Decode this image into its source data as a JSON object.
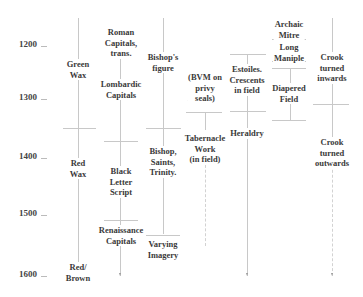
{
  "timeline": {
    "years": [
      {
        "label": "1200",
        "y": 44
      },
      {
        "label": "1300",
        "y": 97
      },
      {
        "label": "1400",
        "y": 156
      },
      {
        "label": "1500",
        "y": 213
      },
      {
        "label": "1600",
        "y": 274
      }
    ]
  },
  "columns": [
    {
      "name": "wax",
      "items": [
        {
          "text": "Green\nWax"
        },
        {
          "text": "Red\nWax"
        },
        {
          "text": "Red/\nBrown"
        }
      ]
    },
    {
      "name": "lettering",
      "items": [
        {
          "text": "Roman\nCapitals,\ntrans."
        },
        {
          "text": "Lombardic\nCapitals"
        },
        {
          "text": "Black\nLetter\nScript"
        },
        {
          "text": "Renaissance\nCapitals"
        }
      ]
    },
    {
      "name": "figure",
      "items": [
        {
          "text": "Bishop's\nfigure"
        },
        {
          "text": "Bishop,\nSaints,\nTrinity."
        },
        {
          "text": "Varying\nImagery"
        }
      ]
    },
    {
      "name": "field-work",
      "items": [
        {
          "text": "(BVM on\nprivy\nseals)"
        },
        {
          "text": "Tabernacle\nWork\n(in field)"
        }
      ]
    },
    {
      "name": "field-devices",
      "items": [
        {
          "text": "Estoiles.\nCrescents\nin field"
        },
        {
          "text": "Heraldry"
        }
      ]
    },
    {
      "name": "vestments",
      "items": [
        {
          "text": "Archaic\nMitre"
        },
        {
          "text": "Long\nManiple"
        },
        {
          "text": "Diapered\nField"
        }
      ]
    },
    {
      "name": "crook",
      "items": [
        {
          "text": "Crook\nturned\ninwards"
        },
        {
          "text": "Crook\nturned\noutwards"
        }
      ]
    }
  ]
}
